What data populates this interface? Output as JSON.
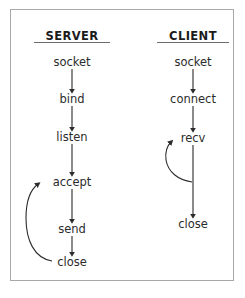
{
  "diagram": {
    "frame": {
      "border_color": "#a8a8a8",
      "background": "#ffffff"
    },
    "ink_color": "#2b2b2b",
    "columns": [
      {
        "id": "server",
        "heading": "SERVER",
        "heading_x": 72,
        "heading_y": 36,
        "rule_y": 42,
        "rule_width": 76,
        "center_x": 72,
        "nodes": [
          {
            "id": "server-socket",
            "label": "socket",
            "x": 72,
            "y": 62
          },
          {
            "id": "server-bind",
            "label": "bind",
            "x": 72,
            "y": 99
          },
          {
            "id": "server-listen",
            "label": "listen",
            "x": 72,
            "y": 137
          },
          {
            "id": "server-accept",
            "label": "accept",
            "x": 72,
            "y": 182
          },
          {
            "id": "server-send",
            "label": "send",
            "x": 72,
            "y": 229
          },
          {
            "id": "server-close",
            "label": "close",
            "x": 72,
            "y": 262
          }
        ],
        "arrows": [
          {
            "id": "arrow-socket-bind",
            "from": "server-socket",
            "to": "server-bind",
            "x": 72,
            "y1": 69,
            "y2": 91
          },
          {
            "id": "arrow-bind-listen",
            "from": "server-bind",
            "to": "server-listen",
            "x": 72,
            "y1": 106,
            "y2": 129
          },
          {
            "id": "arrow-listen-accept",
            "from": "server-listen",
            "to": "server-accept",
            "x": 72,
            "y1": 144,
            "y2": 174
          },
          {
            "id": "arrow-accept-send",
            "from": "server-accept",
            "to": "server-send",
            "x": 72,
            "y1": 189,
            "y2": 221
          },
          {
            "id": "arrow-send-close",
            "from": "server-send",
            "to": "server-close",
            "x": 72,
            "y1": 236,
            "y2": 254
          }
        ],
        "loop": {
          "id": "loop-close-accept",
          "from": "server-close",
          "to": "server-accept",
          "description": "close loops back to accept",
          "path": "M 52 261 C 34 258 26 240 26 218 C 26 200 30 190 38 184"
        }
      },
      {
        "id": "client",
        "heading": "CLIENT",
        "heading_x": 193,
        "heading_y": 36,
        "rule_y": 42,
        "rule_width": 72,
        "center_x": 193,
        "nodes": [
          {
            "id": "client-socket",
            "label": "socket",
            "x": 193,
            "y": 62
          },
          {
            "id": "client-connect",
            "label": "connect",
            "x": 193,
            "y": 99
          },
          {
            "id": "client-recv",
            "label": "recv",
            "x": 193,
            "y": 138
          },
          {
            "id": "client-close",
            "label": "close",
            "x": 193,
            "y": 224
          }
        ],
        "arrows": [
          {
            "id": "arrow-client-socket-connect",
            "from": "client-socket",
            "to": "client-connect",
            "x": 193,
            "y1": 69,
            "y2": 91
          },
          {
            "id": "arrow-client-connect-recv",
            "from": "client-connect",
            "to": "client-recv",
            "x": 193,
            "y1": 106,
            "y2": 130
          },
          {
            "id": "arrow-client-recv-close",
            "from": "client-recv",
            "to": "client-close",
            "x": 193,
            "y1": 145,
            "y2": 216
          }
        ],
        "loop": {
          "id": "loop-recv-recv",
          "from": "client-recv",
          "to": "client-recv",
          "description": "recv loops back to recv",
          "path": "M 192 182 C 178 180 168 172 166 160 C 165 152 167 146 171 142"
        }
      }
    ]
  }
}
